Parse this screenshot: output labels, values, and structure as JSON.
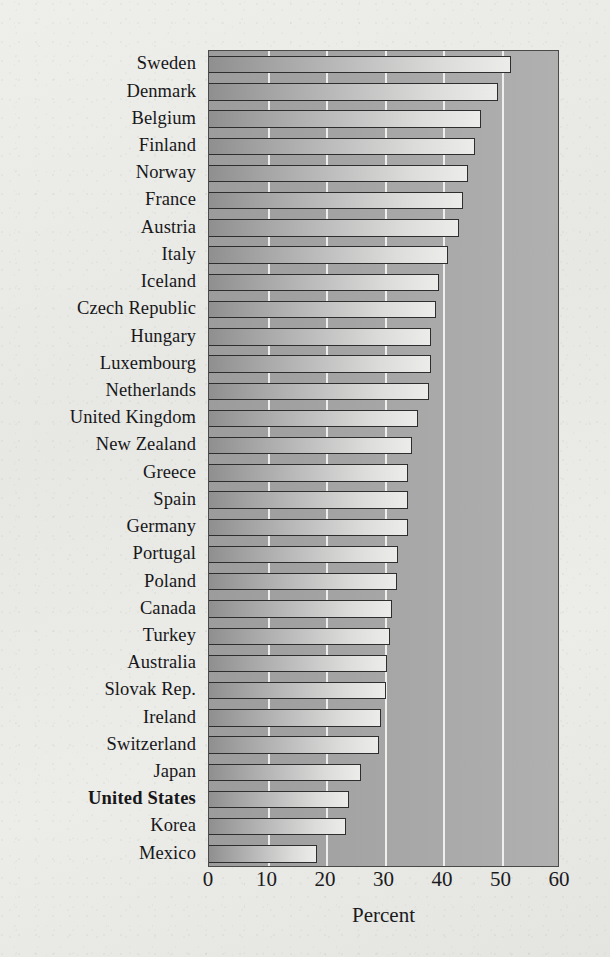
{
  "chart_data": {
    "type": "bar",
    "orientation": "horizontal",
    "title": "",
    "xlabel": "Percent",
    "ylabel": "",
    "xlim": [
      0,
      60
    ],
    "xticks": [
      0,
      10,
      20,
      30,
      40,
      50,
      60
    ],
    "gridlines": [
      10,
      20,
      30,
      40,
      50
    ],
    "grid": true,
    "legend": null,
    "highlight": "United States",
    "categories": [
      "Sweden",
      "Denmark",
      "Belgium",
      "Finland",
      "Norway",
      "France",
      "Austria",
      "Italy",
      "Iceland",
      "Czech Republic",
      "Hungary",
      "Luxembourg",
      "Netherlands",
      "United Kingdom",
      "New Zealand",
      "Greece",
      "Spain",
      "Germany",
      "Portugal",
      "Poland",
      "Canada",
      "Turkey",
      "Australia",
      "Slovak Rep.",
      "Ireland",
      "Switzerland",
      "Japan",
      "United States",
      "Korea",
      "Mexico"
    ],
    "values": [
      51.7,
      49.4,
      46.5,
      45.5,
      44.3,
      43.4,
      42.7,
      40.9,
      39.4,
      38.8,
      38.0,
      37.9,
      37.6,
      35.7,
      34.7,
      34.1,
      34.1,
      34.0,
      32.3,
      32.2,
      31.2,
      30.9,
      30.5,
      30.2,
      29.4,
      29.1,
      25.9,
      24.0,
      23.5,
      18.4
    ],
    "colors": {
      "plot_background": "#a5a5a5",
      "bar_fill_left": "#8f8f8f",
      "bar_fill_right": "#ececea",
      "bar_outline": "#2e2e2e",
      "gridline": "#f2f2f0",
      "page_background": "#e9e9e6",
      "text": "#17171a"
    }
  }
}
